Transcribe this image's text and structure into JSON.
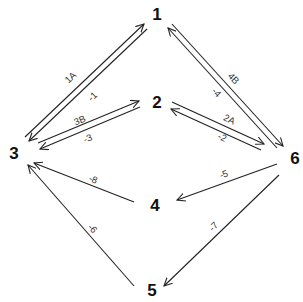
{
  "nodes": [
    {
      "id": "1",
      "label": "1",
      "x": 157,
      "y": 20
    },
    {
      "id": "2",
      "label": "2",
      "x": 157,
      "y": 108
    },
    {
      "id": "3",
      "label": "3",
      "x": 14,
      "y": 159
    },
    {
      "id": "4",
      "label": "4",
      "x": 155,
      "y": 211
    },
    {
      "id": "5",
      "label": "5",
      "x": 152,
      "y": 296
    },
    {
      "id": "6",
      "label": "6",
      "x": 295,
      "y": 164
    }
  ],
  "edges": [
    {
      "from": "3",
      "to": "1",
      "label": "1A",
      "x1": 25,
      "y1": 137,
      "x2": 144,
      "y2": 24,
      "lx": 71,
      "ly": 78,
      "rot": -43
    },
    {
      "from": "1",
      "to": "3",
      "label": "-1",
      "x1": 147,
      "y1": 29,
      "x2": 29,
      "y2": 141,
      "lx": 93,
      "ly": 97,
      "rot": -43
    },
    {
      "from": "3",
      "to": "2",
      "label": "3B",
      "x1": 38,
      "y1": 143,
      "x2": 139,
      "y2": 101,
      "lx": 80,
      "ly": 121,
      "rot": -22
    },
    {
      "from": "2",
      "to": "3",
      "label": "-3",
      "x1": 140,
      "y1": 107,
      "x2": 40,
      "y2": 149,
      "lx": 88,
      "ly": 139,
      "rot": -22
    },
    {
      "from": "1",
      "to": "6",
      "label": "4B",
      "x1": 172,
      "y1": 24,
      "x2": 283,
      "y2": 146,
      "lx": 233,
      "ly": 79,
      "rot": 47
    },
    {
      "from": "6",
      "to": "1",
      "label": "-4",
      "x1": 277,
      "y1": 148,
      "x2": 168,
      "y2": 28,
      "lx": 216,
      "ly": 93,
      "rot": 47
    },
    {
      "from": "2",
      "to": "6",
      "label": "2A",
      "x1": 172,
      "y1": 102,
      "x2": 264,
      "y2": 144,
      "lx": 229,
      "ly": 120,
      "rot": 25
    },
    {
      "from": "6",
      "to": "2",
      "label": "-2",
      "x1": 261,
      "y1": 150,
      "x2": 171,
      "y2": 109,
      "lx": 222,
      "ly": 138,
      "rot": 25
    },
    {
      "from": "6",
      "to": "4",
      "label": "-5",
      "x1": 277,
      "y1": 164,
      "x2": 177,
      "y2": 200,
      "lx": 224,
      "ly": 175,
      "rot": -20
    },
    {
      "from": "6",
      "to": "5",
      "label": "-7",
      "x1": 279,
      "y1": 175,
      "x2": 164,
      "y2": 286,
      "lx": 214,
      "ly": 227,
      "rot": -45
    },
    {
      "from": "4",
      "to": "3",
      "label": "-8",
      "x1": 134,
      "y1": 202,
      "x2": 34,
      "y2": 163,
      "lx": 93,
      "ly": 180,
      "rot": 21
    },
    {
      "from": "5",
      "to": "3",
      "label": "-6",
      "x1": 134,
      "y1": 286,
      "x2": 28,
      "y2": 165,
      "lx": 92,
      "ly": 229,
      "rot": 49
    }
  ],
  "colors": {
    "line": "#222222",
    "node_text": "#111111",
    "edge_text": "#333333",
    "background": "#ffffff"
  }
}
